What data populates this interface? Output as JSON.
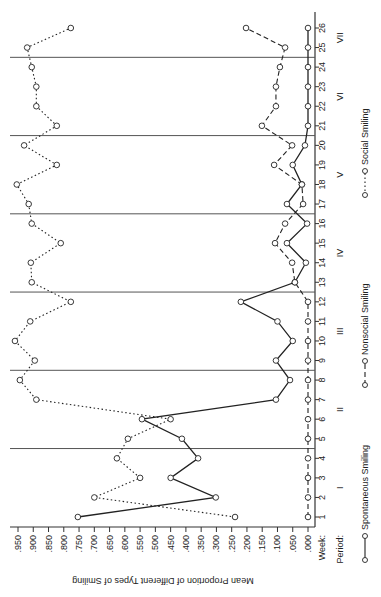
{
  "chart_data": {
    "type": "line",
    "orientation": "rotated-90 (value axis horizontal along bottom, weeks vertical along right)",
    "title": "",
    "ylabel": "Mean Proportion of Different Types of Smiling",
    "xlabel": "Week",
    "x_axis_label": "Week:",
    "period_axis_label": "Period:",
    "ylim": [
      0,
      0.95
    ],
    "y_ticks": [
      ".950",
      ".900",
      ".850",
      ".800",
      ".750",
      ".700",
      ".650",
      ".600",
      ".550",
      ".500",
      ".450",
      ".400",
      ".350",
      ".300",
      ".250",
      ".200",
      ".150",
      ".100",
      ".050",
      ".000"
    ],
    "x": [
      1,
      2,
      3,
      4,
      5,
      6,
      7,
      8,
      9,
      10,
      11,
      12,
      13,
      14,
      15,
      16,
      17,
      18,
      19,
      20,
      21,
      22,
      23,
      24,
      25,
      26
    ],
    "periods": [
      {
        "label": "I",
        "weeks": [
          1,
          4
        ]
      },
      {
        "label": "II",
        "weeks": [
          5,
          8
        ]
      },
      {
        "label": "III",
        "weeks": [
          9,
          12
        ]
      },
      {
        "label": "IV",
        "weeks": [
          13,
          16
        ]
      },
      {
        "label": "V",
        "weeks": [
          17,
          20
        ]
      },
      {
        "label": "VI",
        "weeks": [
          21,
          24
        ]
      },
      {
        "label": "VII",
        "weeks": [
          25,
          26
        ]
      }
    ],
    "period_boundaries_after_week": [
      4,
      8,
      12,
      16,
      20,
      24
    ],
    "series": [
      {
        "name": "Spontaneous Smiling",
        "style": "solid",
        "values": [
          0.754,
          0.302,
          0.45,
          0.36,
          0.413,
          0.544,
          0.105,
          0.059,
          0.105,
          0.05,
          0.1,
          0.22,
          0.043,
          0.007,
          0.069,
          0.003,
          0.069,
          0.02,
          0.05,
          0.01,
          0.0,
          0.0,
          0.0,
          0.0,
          0.0,
          0.0
        ]
      },
      {
        "name": "Nonsocial Smiling",
        "style": "dashed",
        "values": [
          0.0,
          0.0,
          0.0,
          0.0,
          0.0,
          0.0,
          0.0,
          0.0,
          0.0,
          0.0,
          0.0,
          0.0,
          0.043,
          0.052,
          0.108,
          0.075,
          0.016,
          0.02,
          0.111,
          0.052,
          0.151,
          0.105,
          0.105,
          0.092,
          0.075,
          0.203
        ]
      },
      {
        "name": "Social Smiling",
        "style": "dotted",
        "values": [
          0.239,
          0.7,
          0.55,
          0.626,
          0.59,
          0.45,
          0.89,
          0.944,
          0.895,
          0.96,
          0.91,
          0.777,
          0.905,
          0.908,
          0.81,
          0.905,
          0.915,
          0.954,
          0.823,
          0.93,
          0.823,
          0.89,
          0.89,
          0.905,
          0.92,
          0.777
        ]
      }
    ],
    "legend": [
      "Spontaneous Smiling",
      "Nonsocial Smiling",
      "Social Smiling"
    ],
    "legend_position": "right",
    "grid": false
  }
}
